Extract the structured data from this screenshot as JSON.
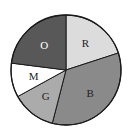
{
  "chart_data": {
    "type": "pie",
    "title": "",
    "start_angle_deg": 0,
    "direction": "clockwise",
    "categories": [
      "R",
      "B",
      "G",
      "M",
      "O"
    ],
    "values": [
      20,
      34,
      13,
      10,
      23
    ],
    "colors": [
      "#dcdcdc",
      "#8a8a8a",
      "#ababab",
      "#ffffff",
      "#585858"
    ],
    "label_colors": [
      "#222222",
      "#222222",
      "#222222",
      "#222222",
      "#ffffff"
    ],
    "legend": "none",
    "labels_inside": true
  },
  "layout": {
    "cx": 66,
    "cy": 70,
    "r": 55
  }
}
